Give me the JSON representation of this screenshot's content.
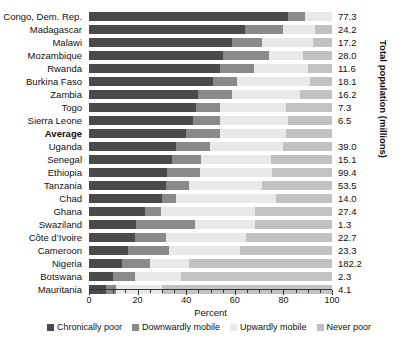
{
  "chart_data": {
    "type": "bar",
    "orientation": "horizontal",
    "stacked": true,
    "title": "",
    "xlabel": "Percent",
    "ylabel": "",
    "y2label": "Total population (millions)",
    "xlim": [
      0,
      100
    ],
    "xticks": [
      0,
      20,
      40,
      60,
      80,
      100
    ],
    "xticklabels": [
      "0",
      "20",
      "40",
      "60",
      "80",
      "100"
    ],
    "grid": false,
    "legend_position": "bottom",
    "series": [
      {
        "name": "Chronically poor",
        "color": "#4a4a4a",
        "values": [
          82.0,
          64.0,
          59.0,
          55.0,
          54.0,
          51.0,
          45.0,
          44.0,
          43.0,
          40.0,
          36.0,
          34.0,
          32.0,
          31.5,
          30.0,
          23.0,
          19.5,
          19.0,
          16.0,
          13.5,
          10.0,
          7.0
        ]
      },
      {
        "name": "Downwardly mobile",
        "color": "#8a8a8a",
        "values": [
          7.0,
          16.0,
          12.0,
          19.0,
          14.0,
          10.0,
          14.0,
          10.0,
          11.0,
          14.0,
          14.0,
          12.0,
          13.5,
          9.5,
          6.0,
          6.5,
          24.0,
          12.5,
          17.0,
          11.5,
          9.0,
          4.0
        ]
      },
      {
        "name": "Upwardly mobile",
        "color": "#e9e9e9",
        "values": [
          11.0,
          13.0,
          21.0,
          14.0,
          22.0,
          30.0,
          28.0,
          27.0,
          28.0,
          27.0,
          30.0,
          29.0,
          30.0,
          30.0,
          41.0,
          39.0,
          25.0,
          33.0,
          29.0,
          16.0,
          19.0,
          19.0
        ]
      },
      {
        "name": "Never poor",
        "color": "#c2c2c2",
        "values": [
          0.0,
          7.0,
          8.0,
          12.0,
          10.0,
          9.0,
          13.0,
          19.0,
          18.0,
          19.0,
          20.0,
          25.0,
          24.5,
          29.0,
          23.0,
          31.5,
          31.5,
          35.5,
          38.0,
          59.0,
          62.0,
          70.0
        ]
      }
    ],
    "categories": [
      "Congo, Dem. Rep.",
      "Madagascar",
      "Malawi",
      "Mozambique",
      "Rwanda",
      "Burkina Faso",
      "Zambia",
      "Togo",
      "Sierra Leone",
      "Average",
      "Uganda",
      "Senegal",
      "Ethiopia",
      "Tanzania",
      "Chad",
      "Ghana",
      "Swaziland",
      "Côte d’Ivoire",
      "Cameroon",
      "Nigeria",
      "Botswana",
      "Mauritania"
    ],
    "bold_categories": [
      "Average"
    ],
    "population_millions": [
      "77.3",
      "24.2",
      "17.2",
      "28.0",
      "11.6",
      "18.1",
      "16.2",
      "7.3",
      "6.5",
      "",
      "39.0",
      "15.1",
      "99.4",
      "53.5",
      "14.0",
      "27.4",
      "1.3",
      "22.7",
      "23.3",
      "182.2",
      "2.3",
      "4.1"
    ]
  },
  "legend": {
    "items": [
      {
        "label": "Chronically poor",
        "color": "#4a4a4a"
      },
      {
        "label": "Downwardly mobile",
        "color": "#8a8a8a"
      },
      {
        "label": "Upwardly mobile",
        "color": "#e9e9e9"
      },
      {
        "label": "Never poor",
        "color": "#c2c2c2"
      }
    ]
  }
}
